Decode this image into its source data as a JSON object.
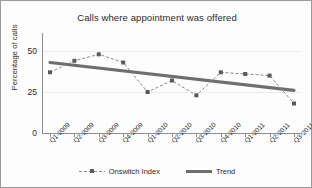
{
  "chart_data": {
    "type": "line",
    "title": "Calls where appointment was offered",
    "xlabel": "",
    "ylabel": "Percentage of calls",
    "ylim": [
      0,
      55
    ],
    "yticks": [
      0,
      25,
      50
    ],
    "grid": true,
    "legend_position": "bottom",
    "categories": [
      "Q1-2009",
      "Q2-2009",
      "Q3-2009",
      "Q4-2009",
      "Q1-2010",
      "Q2-2010",
      "Q3-2010",
      "Q4-2010",
      "Q1-2011",
      "Q2-2011",
      "Q3-2011"
    ],
    "series": [
      {
        "name": "Onswitch Index",
        "style": "dashed-with-square-markers",
        "color": "#7d7d7d",
        "values": [
          37,
          44,
          48,
          43,
          25,
          32,
          23,
          37,
          36,
          35,
          18
        ]
      },
      {
        "name": "Trend",
        "style": "thick-solid",
        "color": "#6e6e6e",
        "values": [
          43.0,
          41.3,
          39.6,
          37.9,
          36.2,
          34.5,
          32.8,
          31.1,
          29.4,
          27.7,
          26.0
        ]
      }
    ]
  },
  "legend": {
    "items": [
      {
        "label": "Onswitch Index"
      },
      {
        "label": "Trend"
      }
    ]
  },
  "colors": {
    "series_line": "#7d7d7d",
    "marker": "#5a5a5a",
    "trend": "#6e6e6e",
    "axis": "#8e8e8e",
    "grid": "#ededed",
    "text": "#2a2a2a",
    "border": "#9a9a9a"
  }
}
